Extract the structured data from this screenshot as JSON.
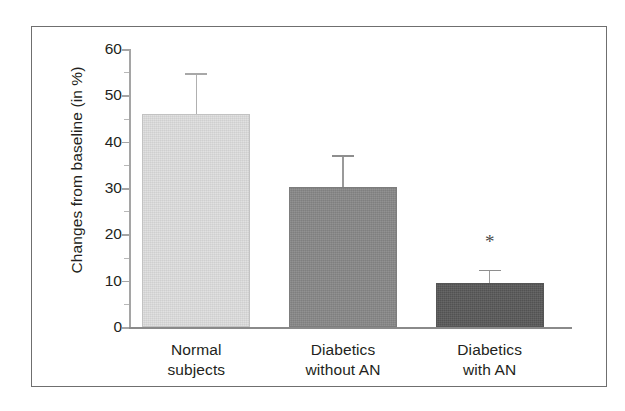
{
  "figure": {
    "background_color": "#ffffff",
    "frame_color": "#6f6f6f",
    "caption_partial": ""
  },
  "chart_data": {
    "type": "bar",
    "title": "",
    "subtitle": "",
    "xlabel": "",
    "ylabel": "Changes from baseline (in %)",
    "categories": [
      "Normal subjects",
      "Diabetics without AN",
      "Diabetics with AN"
    ],
    "category_lines": [
      [
        "Normal",
        "subjects"
      ],
      [
        "Diabetics",
        "without AN"
      ],
      [
        "Diabetics",
        "with AN"
      ]
    ],
    "values": [
      46,
      30.2,
      9.6
    ],
    "errors_upper": [
      8.8,
      6.9,
      2.8
    ],
    "error_tops": [
      54.8,
      37.1,
      12.4
    ],
    "bar_colors": [
      "#dedede",
      "#878787",
      "#585858"
    ],
    "annotations": [
      {
        "text": "*",
        "category": "Diabetics with AN",
        "value": 19.5
      }
    ],
    "ylim": [
      0,
      60
    ],
    "yticks": [
      0,
      10,
      20,
      30,
      40,
      50,
      60
    ],
    "ytick_labels": [
      "0",
      "10",
      "20",
      "30",
      "40",
      "50",
      "60"
    ],
    "yminor_ticks": [
      5,
      15,
      25,
      35,
      45,
      55
    ],
    "grid": false,
    "legend": null,
    "legend_position": "none"
  }
}
